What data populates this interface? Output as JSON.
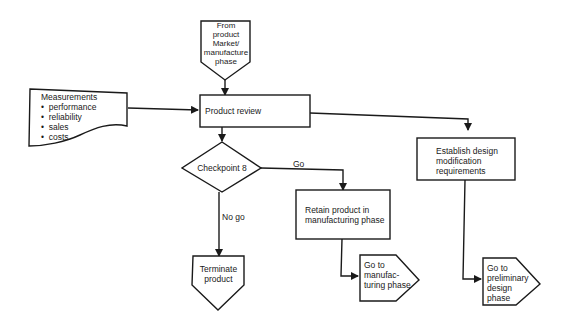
{
  "nodes": {
    "start": {
      "lines": [
        "From",
        "product",
        "Market/",
        "manufacture",
        "phase"
      ]
    },
    "measurements": {
      "title": "Measurements",
      "items": [
        "performance",
        "reliability",
        "sales",
        "costs"
      ]
    },
    "product_review": {
      "label": "Product review"
    },
    "checkpoint": {
      "label": "Checkpoint 8"
    },
    "establish": {
      "lines": [
        "Establish design",
        "modification",
        "requirements"
      ]
    },
    "retain": {
      "lines": [
        "Retain product in",
        "manufacturing phase"
      ]
    },
    "terminate": {
      "lines": [
        "Terminate",
        "product"
      ]
    },
    "go_manufacturing": {
      "lines": [
        "Go to",
        "manufac-",
        "turing phase"
      ]
    },
    "go_preliminary": {
      "lines": [
        "Go to",
        "preliminary",
        "design",
        "phase"
      ]
    }
  },
  "edges": {
    "go": "Go",
    "no_go": "No go"
  },
  "colors": {
    "stroke": "#1a1a1a",
    "background": "#ffffff"
  }
}
